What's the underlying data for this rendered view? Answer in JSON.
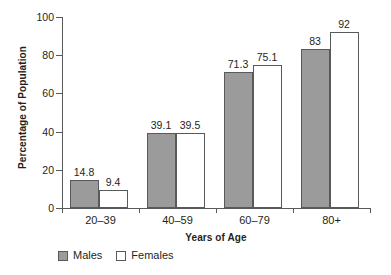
{
  "chart_data": {
    "type": "bar",
    "title": "",
    "xlabel": "Years of Age",
    "ylabel": "Percentage of Population",
    "categories": [
      "20–39",
      "40–59",
      "60–79",
      "80+"
    ],
    "series": [
      {
        "name": "Males",
        "color": "#9b9b9b",
        "values": [
          14.8,
          39.1,
          71.3,
          83
        ]
      },
      {
        "name": "Females",
        "color": "#ffffff",
        "values": [
          9.4,
          39.5,
          75.1,
          92
        ]
      }
    ],
    "value_labels": {
      "males": [
        "14.8",
        "39.1",
        "71.3",
        "83"
      ],
      "females": [
        "9.4",
        "39.5",
        "75.1",
        "92"
      ]
    },
    "ylim": [
      0,
      100
    ],
    "yticks": [
      0,
      20,
      40,
      60,
      80,
      100
    ],
    "ytick_labels": [
      "0",
      "20",
      "40",
      "60",
      "80",
      "100"
    ],
    "grid": false,
    "legend_position": "bottom-left"
  },
  "legend": {
    "items": [
      {
        "label": "Males",
        "swatch": "male"
      },
      {
        "label": "Females",
        "swatch": "female"
      }
    ]
  }
}
